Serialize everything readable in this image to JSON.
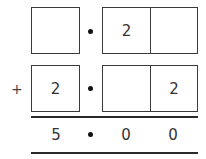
{
  "problem": {
    "operator": "+",
    "row1": {
      "ones_box": "",
      "tenths_box": "2",
      "hundredths_box": ""
    },
    "row2": {
      "ones_box": "2",
      "tenths_box": "",
      "hundredths_box": "2"
    },
    "result": {
      "ones": "5",
      "tenths": "0",
      "hundredths": "0"
    }
  }
}
